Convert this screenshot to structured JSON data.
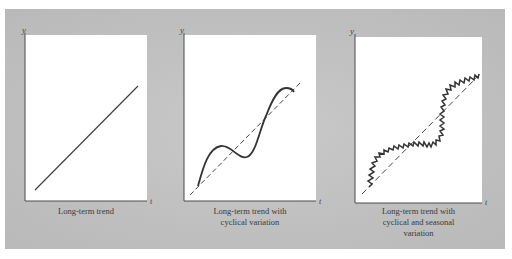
{
  "figure": {
    "background_color": "#c4c4c4",
    "plot_background": "#ffffff",
    "line_color": "#3a3a3a",
    "panels": [
      {
        "id": "long-term-trend",
        "y_label": "y",
        "x_label": "t",
        "caption_lines": [
          "Long-term trend"
        ],
        "components": [
          "trend"
        ]
      },
      {
        "id": "trend-with-cyclical",
        "y_label": "y",
        "x_label": "t",
        "caption_lines": [
          "Long-term trend with",
          "cyclical variation"
        ],
        "components": [
          "trend (dashed)",
          "cyclical"
        ]
      },
      {
        "id": "trend-with-cyclical-seasonal",
        "y_label": "y",
        "x_label": "t",
        "caption_lines": [
          "Long-term trend with",
          "cyclical and seasonal",
          "variation"
        ],
        "components": [
          "trend (dashed)",
          "cyclical",
          "seasonal"
        ]
      }
    ]
  }
}
